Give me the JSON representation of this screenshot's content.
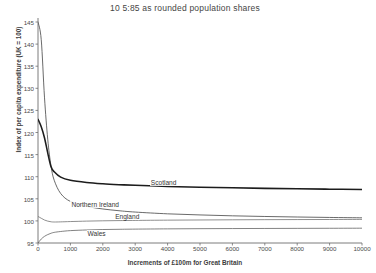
{
  "chart_data": {
    "type": "line",
    "title": "10 5:85 as rounded population shares",
    "xlabel": "Increments of £100m for Great Britain",
    "ylabel": "Index of per capita expenditure (UK = 100)",
    "xlim": [
      0,
      10000
    ],
    "ylim": [
      95,
      145
    ],
    "grid": false,
    "legend_position": "inline-curve-labels",
    "xticks": [
      0,
      1000,
      2000,
      3000,
      4000,
      5000,
      6000,
      7000,
      8000,
      9000,
      10000
    ],
    "yticks": [
      95,
      100,
      105,
      110,
      115,
      120,
      125,
      130,
      135,
      140,
      145
    ],
    "x": [
      0,
      100,
      200,
      300,
      400,
      500,
      700,
      1000,
      1500,
      2000,
      2500,
      3000,
      4000,
      5000,
      6000,
      7000,
      8000,
      9000,
      10000
    ],
    "series": [
      {
        "name": "Northern Ireland",
        "values": [
          145.0,
          141.0,
          128.0,
          118.5,
          112.5,
          109.2,
          106.2,
          104.4,
          103.3,
          102.7,
          102.3,
          102.0,
          101.6,
          101.35,
          101.15,
          101.0,
          100.88,
          100.78,
          100.7
        ],
        "label_x": 1000,
        "label_y": 103.6
      },
      {
        "name": "Scotland",
        "values": [
          123.0,
          121.3,
          118.8,
          115.4,
          112.3,
          111.1,
          109.9,
          109.2,
          108.7,
          108.4,
          108.2,
          108.05,
          107.8,
          107.62,
          107.48,
          107.36,
          107.26,
          107.18,
          107.1
        ],
        "label_x": 3450,
        "label_y": 108.5
      },
      {
        "name": "England",
        "values": [
          101.0,
          100.6,
          100.2,
          99.95,
          99.8,
          99.75,
          99.78,
          99.85,
          99.95,
          100.02,
          100.07,
          100.11,
          100.17,
          100.21,
          100.25,
          100.28,
          100.3,
          100.32,
          100.34
        ],
        "label_x": 2350,
        "label_y": 100.8
      },
      {
        "name": "Wales",
        "values": [
          95.0,
          95.9,
          96.5,
          96.9,
          97.2,
          97.4,
          97.6,
          97.8,
          97.95,
          98.05,
          98.1,
          98.14,
          98.2,
          98.24,
          98.27,
          98.29,
          98.31,
          98.33,
          98.35
        ],
        "label_x": 1500,
        "label_y": 97.1
      }
    ]
  },
  "colors": {
    "axis": "#6d6d6d",
    "scotland": "#1c1c1c",
    "northern_ireland": "#4f4f4f",
    "england": "#6a6a6a",
    "wales": "#5a5a5a",
    "text": "#3c3c3c"
  }
}
